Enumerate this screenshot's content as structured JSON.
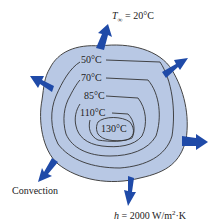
{
  "diagram": {
    "ambient_label": "T∞ = 20°C",
    "ambient_symbol": "T",
    "ambient_sub": "∞",
    "ambient_value": " = 20°C",
    "isotherms": [
      {
        "label": "50°C",
        "x": 81,
        "y": 58
      },
      {
        "label": "70°C",
        "x": 81,
        "y": 76
      },
      {
        "label": "85°C",
        "x": 84,
        "y": 94
      },
      {
        "label": "110°C",
        "x": 80,
        "y": 111
      },
      {
        "label": "130°C",
        "x": 101,
        "y": 125
      }
    ],
    "convection_label": "Convection",
    "h_symbol": "h",
    "h_value": " = 2000 W/m",
    "h_exp": "2",
    "h_unit": "·K",
    "colors": {
      "body_fill": "#b8c8e4",
      "arrow": "#1f4aa8",
      "line": "#333333"
    }
  }
}
